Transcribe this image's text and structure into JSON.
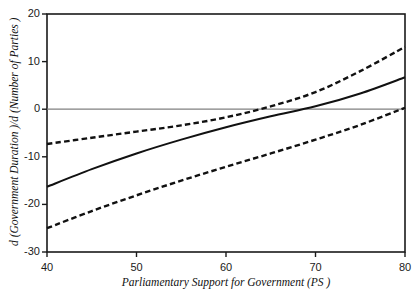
{
  "chart_data": {
    "type": "line",
    "title": "",
    "xlabel": "Parliamentary Support for Government  (PS )",
    "ylabel": "d (Government Duration )/d (Number of Parties )",
    "xlim": [
      40,
      80
    ],
    "ylim": [
      -30,
      20
    ],
    "xticks": [
      40,
      50,
      60,
      70,
      80
    ],
    "yticks": [
      20,
      10,
      0,
      -10,
      -20,
      -30
    ],
    "xtick_labels": [
      "40",
      "50",
      "60",
      "70",
      "80"
    ],
    "ytick_labels": [
      "20",
      "10",
      "0",
      "-10",
      "-20",
      "-30"
    ],
    "grid": false,
    "legend": "none",
    "zero_line": {
      "value": 0,
      "color": "#808080",
      "style": "solid"
    },
    "frame_color": "#1a1a1a",
    "series": [
      {
        "name": "upper confidence bound",
        "style": "dashed",
        "color": "#111111",
        "x": [
          40,
          45,
          50,
          55,
          60,
          65,
          70,
          75,
          80
        ],
        "values": [
          -7.3,
          -6.0,
          -4.7,
          -3.4,
          -1.7,
          0.6,
          3.6,
          8.0,
          13.1
        ]
      },
      {
        "name": "point estimate",
        "style": "solid",
        "color": "#111111",
        "x": [
          40,
          45,
          50,
          55,
          60,
          65,
          70,
          75,
          80
        ],
        "values": [
          -16.3,
          -12.6,
          -9.3,
          -6.4,
          -3.8,
          -1.5,
          0.6,
          3.3,
          6.7
        ]
      },
      {
        "name": "lower confidence bound",
        "style": "dashed",
        "color": "#111111",
        "x": [
          40,
          45,
          50,
          55,
          60,
          65,
          70,
          75,
          80
        ],
        "values": [
          -25.0,
          -21.4,
          -18.1,
          -15.0,
          -12.1,
          -9.3,
          -6.4,
          -3.3,
          0.3
        ]
      }
    ],
    "annotations": [
      {
        "text": "solid line crosses zero near PS = 66"
      },
      {
        "text": "upper dashed bound crosses zero near PS = 61"
      }
    ]
  }
}
